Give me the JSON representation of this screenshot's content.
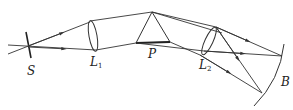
{
  "diagram": {
    "type": "optics-spectrometer",
    "labels": {
      "slit": "S",
      "lens1": "L",
      "lens1_sub": "1",
      "prism": "P",
      "lens2": "L",
      "lens2_sub": "2",
      "screen": "B"
    },
    "colors": {
      "stroke": "#333333",
      "background": "#ffffff"
    }
  }
}
